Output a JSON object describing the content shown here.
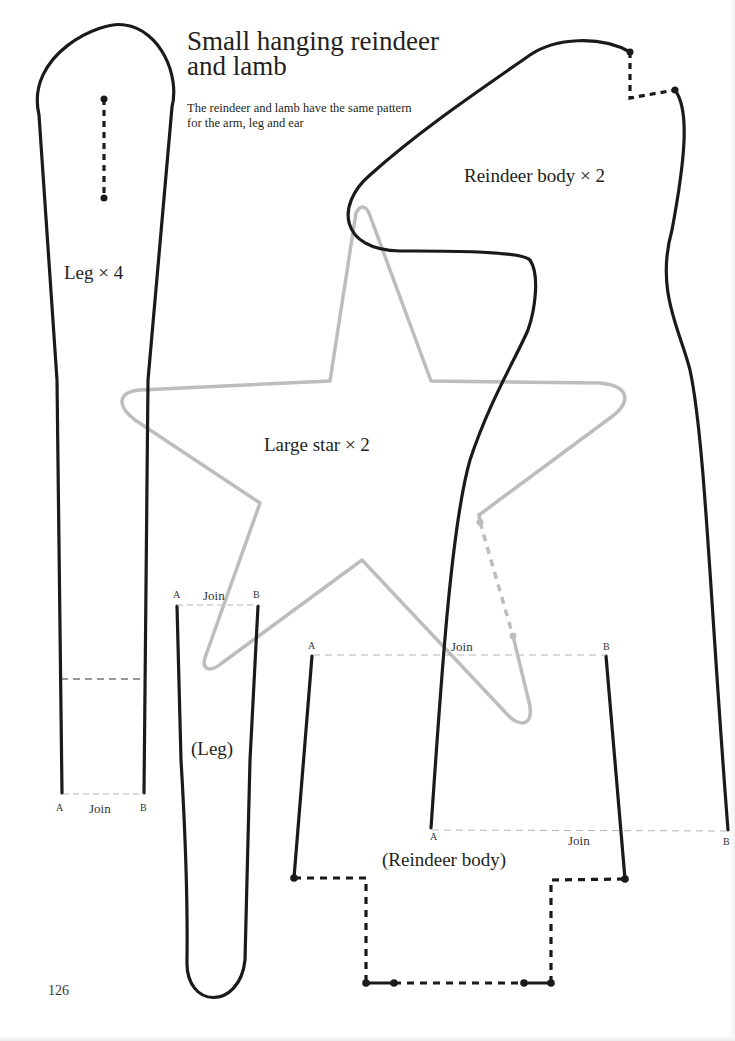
{
  "page": {
    "title_lines": [
      "Small hanging reindeer",
      "and lamb"
    ],
    "subtitle": "The reindeer and lamb have the same pattern for the arm, leg and ear",
    "page_number": "126"
  },
  "pieces": {
    "leg": {
      "label": "Leg × 4",
      "join_label": "Join",
      "point_a": "A",
      "point_b": "B"
    },
    "leg_continuation": {
      "label": "(Leg)",
      "join_label": "Join",
      "point_a": "A",
      "point_b": "B"
    },
    "large_star": {
      "label": "Large star × 2"
    },
    "reindeer_body": {
      "label": "Reindeer body × 2",
      "join_label": "Join",
      "point_a": "A",
      "point_b": "B"
    },
    "reindeer_body_continuation": {
      "label": "(Reindeer body)",
      "join_label": "Join",
      "point_a": "A",
      "point_b": "B"
    }
  },
  "colors": {
    "outline": "#1a1a1a",
    "star_outline": "#bdbdbd",
    "join_line": "#b5b5b5",
    "text": "#231f20"
  }
}
